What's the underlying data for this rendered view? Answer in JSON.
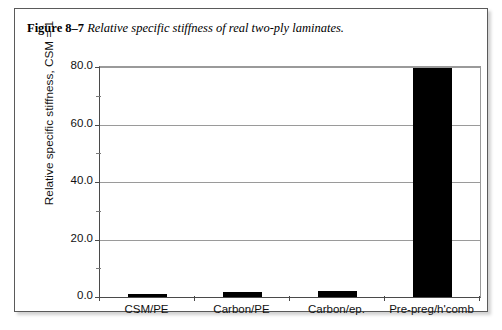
{
  "figure": {
    "caption_label": "Figure 8–7",
    "caption_text": "Relative specific stiffness of real two-ply laminates.",
    "border_color": "#5a5a5a",
    "background": "#ffffff"
  },
  "chart_data": {
    "type": "bar",
    "title": "Relative specific stiffness of real two-ply laminates.",
    "categories": [
      "CSM/PE",
      "Carbon/PE",
      "Carbon/ep.",
      "Pre-preg/h'comb"
    ],
    "values": [
      1.0,
      1.8,
      2.0,
      79.5
    ],
    "xlabel": "",
    "ylabel": "Relative specific stiffness, CSM = 1",
    "ylim": [
      0.0,
      80.0
    ],
    "ytick_labels": [
      "0.0",
      "20.0",
      "40.0",
      "60.0",
      "80.0"
    ],
    "ytick_values": [
      0,
      20,
      40,
      60,
      80
    ],
    "yminor_tick_values": [
      10,
      30,
      50,
      70
    ],
    "grid": "horizontal-major",
    "legend": "none",
    "bar_color": "#000000",
    "grid_color": "#9a9a9a",
    "axis_color": "#4a4a4a"
  }
}
